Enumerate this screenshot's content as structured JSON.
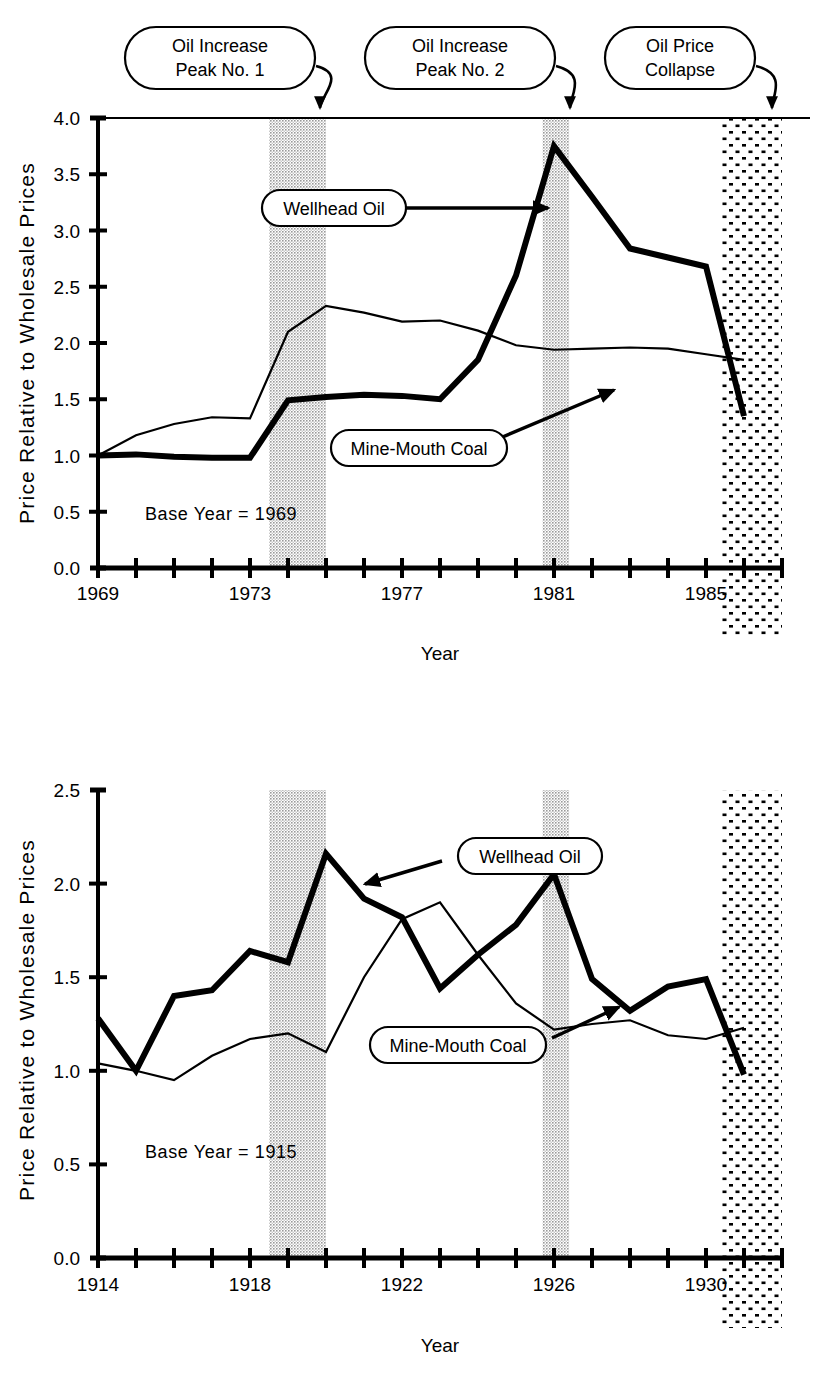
{
  "figure": {
    "callouts": [
      {
        "id": "peak1",
        "lines": [
          "Oil Increase",
          "Peak No. 1"
        ]
      },
      {
        "id": "peak2",
        "lines": [
          "Oil Increase",
          "Peak No. 2"
        ]
      },
      {
        "id": "collapse",
        "lines": [
          "Oil  Price",
          "Collapse"
        ]
      }
    ],
    "colors": {
      "ink": "#000000",
      "background": "#ffffff",
      "band_gray": "#b4b4b4",
      "band_dots": "#000000"
    }
  },
  "chart_data": [
    {
      "id": "top-panel",
      "type": "line",
      "title": "",
      "xlabel": "Year",
      "ylabel": "Price Relative to Wholesale Prices",
      "note": "Base Year = 1969",
      "xlim": [
        1969,
        1987
      ],
      "ylim": [
        0.0,
        4.0
      ],
      "grid": false,
      "legend": "inline-callout-labels",
      "xticks": [
        1969,
        1970,
        1971,
        1972,
        1973,
        1974,
        1975,
        1976,
        1977,
        1978,
        1979,
        1980,
        1981,
        1982,
        1983,
        1984,
        1985,
        1986,
        1987
      ],
      "xticklabels": [
        "1969",
        "",
        "",
        "",
        "1973",
        "",
        "",
        "",
        "1977",
        "",
        "",
        "",
        "1981",
        "",
        "",
        "",
        "1985",
        "",
        ""
      ],
      "yticks": [
        0.0,
        0.5,
        1.0,
        1.5,
        2.0,
        2.5,
        3.0,
        3.5,
        4.0
      ],
      "yticklabels": [
        "0.0",
        "0.5",
        "1.0",
        "1.5",
        "2.0",
        "2.5",
        "3.0",
        "3.5",
        "4.0"
      ],
      "x": [
        1969,
        1970,
        1971,
        1972,
        1973,
        1974,
        1975,
        1976,
        1977,
        1978,
        1979,
        1980,
        1981,
        1982,
        1983,
        1984,
        1985,
        1986
      ],
      "series": [
        {
          "name": "Wellhead Oil",
          "style": "thick",
          "values": [
            1.0,
            1.01,
            0.99,
            0.98,
            0.98,
            1.49,
            1.52,
            1.54,
            1.53,
            1.5,
            1.85,
            2.6,
            3.75,
            3.3,
            2.84,
            2.76,
            2.68,
            1.35
          ]
        },
        {
          "name": "Mine-Mouth Coal",
          "style": "thin",
          "values": [
            1.0,
            1.18,
            1.28,
            1.34,
            1.33,
            2.1,
            2.33,
            2.27,
            2.19,
            2.2,
            2.11,
            1.98,
            1.94,
            1.95,
            1.96,
            1.95,
            1.9,
            1.85
          ]
        }
      ],
      "bands": [
        {
          "id": "oil-increase-peak-1",
          "style": "gray",
          "x0": 1973.5,
          "x1": 1975.0
        },
        {
          "id": "oil-increase-peak-2",
          "style": "gray",
          "x0": 1980.7,
          "x1": 1981.4
        },
        {
          "id": "oil-price-collapse",
          "style": "dots",
          "x0": 1985.4,
          "x1": 1987.0
        }
      ],
      "annotations": [
        {
          "label": "Wellhead Oil",
          "points_to": 1980.6
        },
        {
          "label": "Mine-Mouth Coal",
          "points_to": 1983.0
        }
      ]
    },
    {
      "id": "bottom-panel",
      "type": "line",
      "title": "",
      "xlabel": "Year",
      "ylabel": "Price Relative to Wholesale Prices",
      "note": "Base Year = 1915",
      "xlim": [
        1914,
        1932
      ],
      "ylim": [
        0.0,
        2.5
      ],
      "grid": false,
      "legend": "inline-callout-labels",
      "xticks": [
        1914,
        1915,
        1916,
        1917,
        1918,
        1919,
        1920,
        1921,
        1922,
        1923,
        1924,
        1925,
        1926,
        1927,
        1928,
        1929,
        1930,
        1931,
        1932
      ],
      "xticklabels": [
        "1914",
        "",
        "",
        "",
        "1918",
        "",
        "",
        "",
        "1922",
        "",
        "",
        "",
        "1926",
        "",
        "",
        "",
        "1930",
        "",
        ""
      ],
      "yticks": [
        0.0,
        0.5,
        1.0,
        1.5,
        2.0,
        2.5
      ],
      "yticklabels": [
        "0.0",
        "0.5",
        "1.0",
        "1.5",
        "2.0",
        "2.5"
      ],
      "x": [
        1914,
        1915,
        1916,
        1917,
        1918,
        1919,
        1920,
        1921,
        1922,
        1923,
        1924,
        1925,
        1926,
        1927,
        1928,
        1929,
        1930,
        1931
      ],
      "series": [
        {
          "name": "Wellhead Oil",
          "style": "thick",
          "values": [
            1.28,
            1.0,
            1.4,
            1.43,
            1.64,
            1.58,
            2.16,
            1.92,
            1.82,
            1.44,
            1.62,
            1.78,
            2.05,
            1.49,
            1.32,
            1.45,
            1.49,
            0.98
          ]
        },
        {
          "name": "Mine-Mouth Coal",
          "style": "thin",
          "values": [
            1.04,
            1.0,
            0.95,
            1.08,
            1.17,
            1.2,
            1.1,
            1.5,
            1.81,
            1.9,
            1.62,
            1.36,
            1.22,
            1.25,
            1.27,
            1.19,
            1.17,
            1.23
          ]
        }
      ],
      "bands": [
        {
          "id": "oil-increase-peak-1",
          "style": "gray",
          "x0": 1918.5,
          "x1": 1920.0
        },
        {
          "id": "oil-increase-peak-2",
          "style": "gray",
          "x0": 1925.7,
          "x1": 1926.4
        },
        {
          "id": "oil-price-collapse",
          "style": "dots",
          "x0": 1930.4,
          "x1": 1932.0
        }
      ],
      "annotations": [
        {
          "label": "Wellhead Oil",
          "points_to": 1920.3
        },
        {
          "label": "Mine-Mouth Coal",
          "points_to": 1926.7
        }
      ]
    }
  ],
  "labels": {
    "wellhead_oil": "Wellhead Oil",
    "mine_mouth_coal": "Mine-Mouth Coal",
    "year": "Year",
    "ylabel": "Price Relative to Wholesale Prices",
    "base_year_top": "Base Year = 1969",
    "base_year_bottom": "Base Year = 1915"
  }
}
